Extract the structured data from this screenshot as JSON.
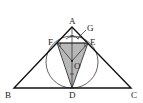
{
  "figure": {
    "labels": {
      "A": "A",
      "B": "B",
      "C": "C",
      "D": "D",
      "E": "E",
      "F": "F",
      "G": "G",
      "O": "O"
    },
    "colors": {
      "shade": "#b8b8b8",
      "line": "#111111"
    }
  }
}
